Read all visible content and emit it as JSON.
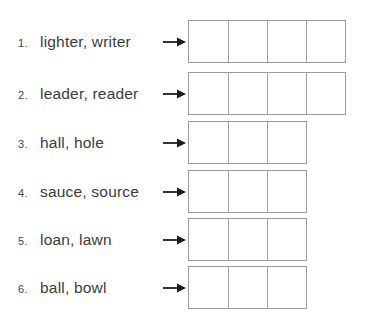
{
  "page": {
    "kind": "pronunciation-worksheet",
    "text_color": "#3c3c3c",
    "box_border_color": "#9c9c9c",
    "arrow_color": "#1e1e1e",
    "background": "#ffffff"
  },
  "icons": {
    "arrow": "right-arrow"
  },
  "rows": [
    {
      "number": "1.",
      "words": "lighter, writer",
      "cells": 4
    },
    {
      "number": "2.",
      "words": "leader, reader",
      "cells": 4
    },
    {
      "number": "3.",
      "words": "hall, hole",
      "cells": 3
    },
    {
      "number": "4.",
      "words": "sauce, source",
      "cells": 3
    },
    {
      "number": "5.",
      "words": "loan, lawn",
      "cells": 3
    },
    {
      "number": "6.",
      "words": "ball, bowl",
      "cells": 3
    }
  ]
}
